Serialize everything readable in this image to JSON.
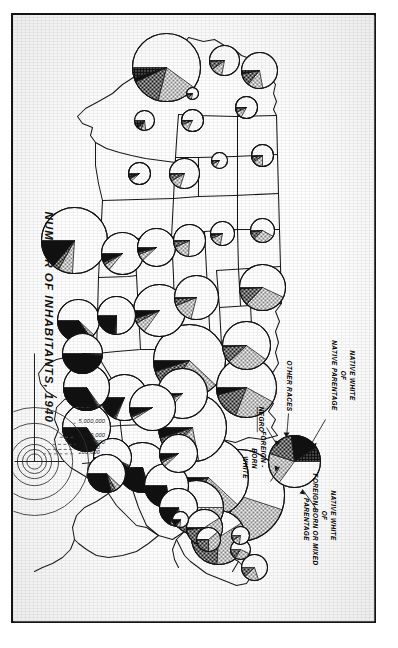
{
  "figure": {
    "title": "NUMBER OF INHABITANTS, 1940",
    "medium": "black-and-white printed census plate, photocopied, rotated 90 degrees"
  },
  "legend": {
    "labels": [
      "NATIVE WHITE OF NATIVE PARENTAGE",
      "OTHER RACES",
      "NEGRO",
      "FOREIGN-BORN WHITE",
      "NATIVE WHITE OF FOREIGN-BORN OR MIXED PARENTAGE"
    ],
    "label_lines": {
      "native_white_native": [
        "NATIVE WHITE",
        "OF",
        "NATIVE PARENTAGE"
      ],
      "other_races": [
        "OTHER RACES"
      ],
      "negro": [
        "NEGRO"
      ],
      "foreign_born_white": [
        "FOREIGN -",
        "BORN",
        "WHITE"
      ],
      "native_white_mixed": [
        "NATIVE WHITE",
        "OF",
        "FOREIGN-BORN OR MIXED",
        "PARENTAGE"
      ]
    },
    "swatch_names": {
      "native_white_native": "white-blank",
      "native_white_mixed": "dotted-screen",
      "foreign_born_white": "cross-hatch",
      "negro": "solid-black",
      "other_races": "stipple-dots"
    }
  },
  "scale": {
    "caption": "NUMBER OF INHABITANTS, 1940",
    "ticks": [
      "10,000,000",
      "5,000,000",
      "2,000,000",
      "1,000,000",
      "500,000",
      "200,000"
    ]
  },
  "chart_data": {
    "type": "pie",
    "title": "NUMBER OF INHABITANTS, 1940",
    "encoding": "Proportional-area pie chart per state: circle area = total population; wedges = population composition.",
    "categories": [
      "Native white of native parentage",
      "Native white of foreign-born or mixed parentage",
      "Foreign-born white",
      "Negro",
      "Other races"
    ],
    "category_fills": [
      "white-blank",
      "dotted-screen",
      "cross-hatch",
      "solid-black",
      "stipple-dots"
    ],
    "legend_position": "top-right of plate",
    "area_scale_ticks": [
      10000000,
      5000000,
      2000000,
      1000000,
      500000,
      200000
    ],
    "series": [
      {
        "state": "New York",
        "total": 13479142,
        "r": 46,
        "values": [
          55,
          27,
          14,
          4,
          0
        ]
      },
      {
        "state": "Pennsylvania",
        "total": 9900180,
        "r": 40,
        "values": [
          62,
          22,
          11,
          5,
          0
        ]
      },
      {
        "state": "Illinois",
        "total": 7897241,
        "r": 36,
        "values": [
          62,
          23,
          10,
          5,
          0
        ]
      },
      {
        "state": "Ohio",
        "total": 6907612,
        "r": 34,
        "values": [
          72,
          15,
          8,
          5,
          0
        ]
      },
      {
        "state": "California",
        "total": 6907387,
        "r": 34,
        "values": [
          60,
          19,
          14,
          2,
          5
        ]
      },
      {
        "state": "Texas",
        "total": 6414824,
        "r": 33,
        "values": [
          76,
          7,
          3,
          14,
          0
        ]
      },
      {
        "state": "Michigan",
        "total": 5256106,
        "r": 30,
        "values": [
          58,
          23,
          15,
          4,
          0
        ]
      },
      {
        "state": "Massachusetts",
        "total": 4316721,
        "r": 27,
        "values": [
          41,
          35,
          23,
          1,
          0
        ]
      },
      {
        "state": "New Jersey",
        "total": 4160165,
        "r": 27,
        "values": [
          50,
          27,
          17,
          6,
          0
        ]
      },
      {
        "state": "Missouri",
        "total": 3784664,
        "r": 26,
        "values": [
          85,
          7,
          3,
          5,
          0
        ]
      },
      {
        "state": "North Carolina",
        "total": 3571623,
        "r": 25,
        "values": [
          70,
          1,
          1,
          27,
          1
        ]
      },
      {
        "state": "Indiana",
        "total": 3427796,
        "r": 25,
        "values": [
          86,
          7,
          3,
          4,
          0
        ]
      },
      {
        "state": "Georgia",
        "total": 3123723,
        "r": 24,
        "values": [
          65,
          1,
          1,
          33,
          0
        ]
      },
      {
        "state": "Wisconsin",
        "total": 3137587,
        "r": 24,
        "values": [
          60,
          28,
          11,
          1,
          0
        ]
      },
      {
        "state": "Tennessee",
        "total": 2915841,
        "r": 23,
        "values": [
          81,
          1,
          1,
          17,
          0
        ]
      },
      {
        "state": "Kentucky",
        "total": 2845627,
        "r": 23,
        "values": [
          91,
          2,
          1,
          6,
          0
        ]
      },
      {
        "state": "Alabama",
        "total": 2832961,
        "r": 23,
        "values": [
          65,
          1,
          1,
          33,
          0
        ]
      },
      {
        "state": "Minnesota",
        "total": 2792300,
        "r": 23,
        "values": [
          57,
          30,
          12,
          1,
          0
        ]
      },
      {
        "state": "Virginia",
        "total": 2677773,
        "r": 22,
        "values": [
          72,
          2,
          1,
          25,
          0
        ]
      },
      {
        "state": "Iowa",
        "total": 2538268,
        "r": 22,
        "values": [
          79,
          15,
          5,
          1,
          0
        ]
      },
      {
        "state": "Louisiana",
        "total": 2363880,
        "r": 21,
        "values": [
          62,
          3,
          1,
          34,
          0
        ]
      },
      {
        "state": "Oklahoma",
        "total": 2336434,
        "r": 21,
        "values": [
          86,
          5,
          2,
          7,
          0
        ]
      },
      {
        "state": "Mississippi",
        "total": 2183796,
        "r": 20,
        "values": [
          50,
          1,
          1,
          48,
          0
        ]
      },
      {
        "state": "Arkansas",
        "total": 1949387,
        "r": 19,
        "values": [
          75,
          1,
          1,
          23,
          0
        ]
      },
      {
        "state": "South Carolina",
        "total": 1899804,
        "r": 19,
        "values": [
          57,
          1,
          1,
          41,
          0
        ]
      },
      {
        "state": "West Virginia",
        "total": 1901974,
        "r": 19,
        "values": [
          88,
          4,
          2,
          6,
          0
        ]
      },
      {
        "state": "Kansas",
        "total": 1801028,
        "r": 19,
        "values": [
          88,
          6,
          2,
          4,
          0
        ]
      },
      {
        "state": "Washington",
        "total": 1736191,
        "r": 18,
        "values": [
          72,
          14,
          11,
          1,
          2
        ]
      },
      {
        "state": "Maryland",
        "total": 1821244,
        "r": 19,
        "values": [
          72,
          7,
          4,
          17,
          0
        ]
      },
      {
        "state": "Connecticut",
        "total": 1709242,
        "r": 18,
        "values": [
          41,
          34,
          23,
          2,
          0
        ]
      },
      {
        "state": "Florida",
        "total": 1897414,
        "r": 19,
        "values": [
          62,
          5,
          4,
          29,
          0
        ]
      },
      {
        "state": "Nebraska",
        "total": 1315834,
        "r": 16,
        "values": [
          76,
          17,
          6,
          1,
          0
        ]
      },
      {
        "state": "Colorado",
        "total": 1123296,
        "r": 15,
        "values": [
          80,
          12,
          7,
          1,
          0
        ]
      },
      {
        "state": "Oregon",
        "total": 1089684,
        "r": 15,
        "values": [
          78,
          12,
          9,
          0,
          1
        ]
      },
      {
        "state": "Maine",
        "total": 847226,
        "r": 13,
        "values": [
          70,
          18,
          12,
          0,
          0
        ]
      },
      {
        "state": "South Dakota",
        "total": 642961,
        "r": 12,
        "values": [
          78,
          15,
          4,
          0,
          3
        ]
      },
      {
        "state": "North Dakota",
        "total": 641935,
        "r": 12,
        "values": [
          58,
          30,
          10,
          0,
          2
        ]
      },
      {
        "state": "Rhode Island",
        "total": 713346,
        "r": 12,
        "values": [
          39,
          36,
          24,
          1,
          0
        ]
      },
      {
        "state": "Montana",
        "total": 559456,
        "r": 11,
        "values": [
          75,
          15,
          8,
          0,
          2
        ]
      },
      {
        "state": "Utah",
        "total": 550310,
        "r": 11,
        "values": [
          82,
          12,
          5,
          0,
          1
        ]
      },
      {
        "state": "New Hampshire",
        "total": 491524,
        "r": 10,
        "values": [
          57,
          27,
          16,
          0,
          0
        ]
      },
      {
        "state": "Idaho",
        "total": 524873,
        "r": 11,
        "values": [
          83,
          10,
          6,
          0,
          1
        ]
      },
      {
        "state": "New Mexico",
        "total": 531818,
        "r": 11,
        "values": [
          88,
          4,
          2,
          1,
          5
        ]
      },
      {
        "state": "Arizona",
        "total": 499261,
        "r": 10,
        "values": [
          73,
          8,
          6,
          3,
          10
        ]
      },
      {
        "state": "Vermont",
        "total": 359231,
        "r": 9,
        "values": [
          77,
          14,
          9,
          0,
          0
        ]
      },
      {
        "state": "Delaware",
        "total": 266505,
        "r": 8,
        "values": [
          76,
          8,
          3,
          13,
          0
        ]
      },
      {
        "state": "Wyoming",
        "total": 250742,
        "r": 8,
        "values": [
          83,
          10,
          6,
          1,
          0
        ]
      },
      {
        "state": "Nevada",
        "total": 110247,
        "r": 6,
        "values": [
          78,
          9,
          8,
          1,
          4
        ]
      }
    ]
  }
}
